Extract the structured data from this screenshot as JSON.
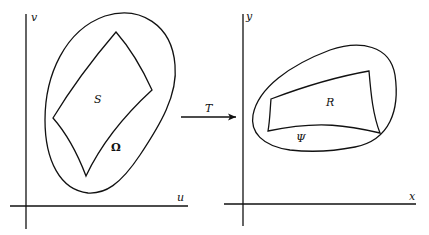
{
  "figure": {
    "left_panel": {
      "x_axis": "u",
      "y_axis": "v",
      "inner_region": "S",
      "outer_region": "Ω"
    },
    "mapping": {
      "label": "T"
    },
    "right_panel": {
      "x_axis": "x",
      "y_axis": "y",
      "inner_region": "R",
      "outer_region": "Ψ"
    }
  }
}
